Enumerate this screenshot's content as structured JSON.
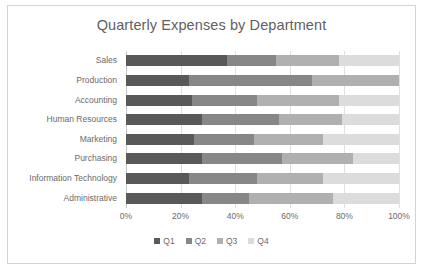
{
  "chart_data": {
    "type": "bar",
    "variant": "stacked-horizontal-100pct",
    "title": "Quarterly Expenses by Department",
    "xlabel": "",
    "ylabel": "",
    "xlim": [
      0,
      100
    ],
    "xticks": [
      "0%",
      "20%",
      "40%",
      "60%",
      "80%",
      "100%"
    ],
    "xtick_values": [
      0,
      20,
      40,
      60,
      80,
      100
    ],
    "grid": true,
    "legend_position": "bottom",
    "categories": [
      "Sales",
      "Production",
      "Accounting",
      "Human Resources",
      "Marketing",
      "Purchasing",
      "Information Technology",
      "Administrative"
    ],
    "series": [
      {
        "name": "Q1",
        "color": "#595959",
        "values": [
          37,
          23,
          24,
          28,
          25,
          28,
          23,
          28
        ]
      },
      {
        "name": "Q2",
        "color": "#878787",
        "values": [
          18,
          45,
          24,
          28,
          22,
          29,
          25,
          17
        ]
      },
      {
        "name": "Q3",
        "color": "#b0b0b0",
        "values": [
          23,
          32,
          30,
          23,
          25,
          26,
          24,
          31
        ]
      },
      {
        "name": "Q4",
        "color": "#dcdcdc",
        "values": [
          22,
          0,
          22,
          21,
          28,
          17,
          28,
          24
        ]
      }
    ]
  },
  "legend": {
    "items": [
      {
        "label": "Q1",
        "color": "#595959"
      },
      {
        "label": "Q2",
        "color": "#878787"
      },
      {
        "label": "Q3",
        "color": "#b0b0b0"
      },
      {
        "label": "Q4",
        "color": "#dcdcdc"
      }
    ]
  }
}
